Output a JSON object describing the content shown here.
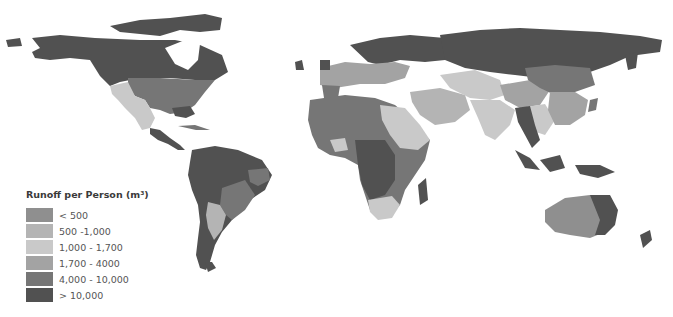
{
  "map": {
    "title": "Runoff per Person (m³)",
    "type": "choropleth world map",
    "legend": {
      "title": "Runoff per Person (m³)",
      "items": [
        {
          "label": "< 500",
          "color": "#8f8f8f"
        },
        {
          "label": "500 -1,000",
          "color": "#b4b4b4"
        },
        {
          "label": "1,000 - 1,700",
          "color": "#c9c9c9"
        },
        {
          "label": "1,700 - 4000",
          "color": "#a3a3a3"
        },
        {
          "label": "4,000 - 10,000",
          "color": "#767676"
        },
        {
          "label": "> 10,000",
          "color": "#515151"
        }
      ]
    },
    "colors": {
      "c500": "#8f8f8f",
      "c1000": "#b4b4b4",
      "c1700": "#c9c9c9",
      "c4000": "#a3a3a3",
      "c10000": "#767676",
      "cmax": "#515151"
    }
  }
}
